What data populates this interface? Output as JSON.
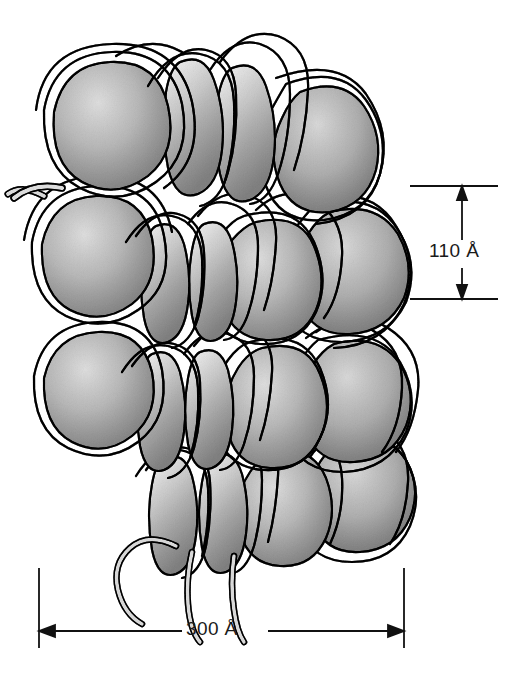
{
  "figure": {
    "background_color": "#ffffff"
  },
  "annotations": {
    "vertical_dimension": {
      "label": "110 Å",
      "value": 110,
      "unit": "Å",
      "orientation": "vertical",
      "position": "right"
    },
    "horizontal_dimension": {
      "label": "300 Å",
      "value": 300,
      "unit": "Å",
      "orientation": "horizontal",
      "position": "bottom"
    }
  },
  "style": {
    "line_color": "#111111",
    "core_fill_light": "#e3e3e3",
    "core_fill_mid": "#cfcfcf",
    "core_fill_dark": "#b3b3b3",
    "dna_fill_light": "#f4f4f4",
    "dna_fill_mid": "#d9d9d9",
    "dna_fill_dark": "#bfbfbf"
  },
  "structure": {
    "nucleosome_cores": [
      {
        "id": "core-1",
        "cx": 108,
        "cy": 122,
        "rx": 52,
        "ry": 48,
        "rot": -12
      },
      {
        "id": "core-2",
        "cx": 196,
        "cy": 110,
        "rx": 30,
        "ry": 52,
        "rot": -8
      },
      {
        "id": "core-3",
        "cx": 262,
        "cy": 118,
        "rx": 44,
        "ry": 56,
        "rot": 6
      },
      {
        "id": "core-4",
        "cx": 336,
        "cy": 168,
        "rx": 48,
        "ry": 54,
        "rot": 10
      },
      {
        "id": "core-5",
        "cx": 92,
        "cy": 262,
        "rx": 52,
        "ry": 50,
        "rot": -6
      },
      {
        "id": "core-6",
        "cx": 172,
        "cy": 272,
        "rx": 30,
        "ry": 56,
        "rot": -4
      },
      {
        "id": "core-7",
        "cx": 228,
        "cy": 276,
        "rx": 28,
        "ry": 58,
        "rot": 4
      },
      {
        "id": "core-8",
        "cx": 296,
        "cy": 268,
        "rx": 46,
        "ry": 54,
        "rot": 2
      },
      {
        "id": "core-9",
        "cx": 362,
        "cy": 262,
        "rx": 42,
        "ry": 50,
        "rot": 8
      },
      {
        "id": "core-10",
        "cx": 96,
        "cy": 398,
        "rx": 52,
        "ry": 48,
        "rot": -8
      },
      {
        "id": "core-11",
        "cx": 176,
        "cy": 404,
        "rx": 30,
        "ry": 54,
        "rot": -4
      },
      {
        "id": "core-12",
        "cx": 232,
        "cy": 406,
        "rx": 28,
        "ry": 56,
        "rot": 4
      },
      {
        "id": "core-13",
        "cx": 300,
        "cy": 396,
        "rx": 46,
        "ry": 52,
        "rot": 2
      },
      {
        "id": "core-14",
        "cx": 362,
        "cy": 392,
        "rx": 40,
        "ry": 48,
        "rot": 8
      },
      {
        "id": "core-15",
        "cx": 186,
        "cy": 508,
        "rx": 30,
        "ry": 52,
        "rot": -4
      },
      {
        "id": "core-16",
        "cx": 244,
        "cy": 506,
        "rx": 28,
        "ry": 54,
        "rot": 4
      },
      {
        "id": "core-17",
        "cx": 308,
        "cy": 498,
        "rx": 46,
        "ry": 52,
        "rot": 2
      },
      {
        "id": "core-18",
        "cx": 366,
        "cy": 486,
        "rx": 36,
        "ry": 46,
        "rot": 8
      }
    ],
    "dna_linker_tails": [
      {
        "id": "tail-left-upper",
        "start": "left-edge",
        "y": 192
      },
      {
        "id": "tail-left-lower",
        "start": "left-edge",
        "y": 534
      }
    ]
  }
}
